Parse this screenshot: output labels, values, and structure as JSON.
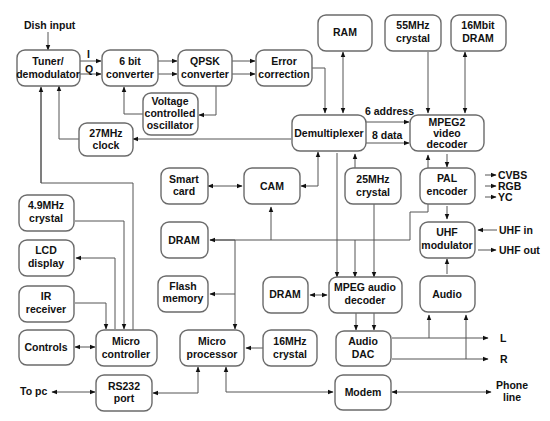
{
  "blocks": {
    "tuner": {
      "line1": "Tuner/",
      "line2": "demodulator"
    },
    "conv6": {
      "line1": "6 bit",
      "line2": "converter"
    },
    "qpsk": {
      "line1": "QPSK",
      "line2": "converter"
    },
    "errcorr": {
      "line1": "Error",
      "line2": "correction"
    },
    "vco": {
      "line1": "Voltage",
      "line2": "controlled",
      "line3": "oscillator"
    },
    "clock27": {
      "line1": "27MHz",
      "line2": "clock"
    },
    "ram": {
      "line1": "RAM"
    },
    "crystal55": {
      "line1": "55MHz",
      "line2": "crystal"
    },
    "dram16": {
      "line1": "16Mbit",
      "line2": "DRAM"
    },
    "demux": {
      "line1": "Demultiplexer"
    },
    "mpeg2": {
      "line1": "MPEG2",
      "line2": "video",
      "line3": "decoder"
    },
    "smartcard": {
      "line1": "Smart",
      "line2": "card"
    },
    "cam": {
      "line1": "CAM"
    },
    "crystal25": {
      "line1": "25MHz",
      "line2": "crystal"
    },
    "pal": {
      "line1": "PAL",
      "line2": "encoder"
    },
    "crystal49": {
      "line1": "4.9MHz",
      "line2": "crystal"
    },
    "dramL": {
      "line1": "DRAM"
    },
    "uhf": {
      "line1": "UHF",
      "line2": "modulator"
    },
    "lcd": {
      "line1": "LCD",
      "line2": "display"
    },
    "flash": {
      "line1": "Flash",
      "line2": "memory"
    },
    "dramA": {
      "line1": "DRAM"
    },
    "mpegaudio": {
      "line1": "MPEG audio",
      "line2": "decoder"
    },
    "audio": {
      "line1": "Audio"
    },
    "ir": {
      "line1": "IR",
      "line2": "receiver"
    },
    "controls": {
      "line1": "Controls"
    },
    "microctrl": {
      "line1": "Micro",
      "line2": "controller"
    },
    "microproc": {
      "line1": "Micro",
      "line2": "processor"
    },
    "crystal16": {
      "line1": "16MHz",
      "line2": "crystal"
    },
    "audiodac": {
      "line1": "Audio",
      "line2": "DAC"
    },
    "rs232": {
      "line1": "RS232",
      "line2": "port"
    },
    "modem": {
      "line1": "Modem"
    }
  },
  "labels": {
    "dish_input": "Dish input",
    "i": "I",
    "q": "Q",
    "addr": "6 address",
    "data": "8 data",
    "cvbs": "CVBS",
    "rgb": "RGB",
    "yc": "YC",
    "uhf_in": "UHF in",
    "uhf_out": "UHF out",
    "l": "L",
    "r": "R",
    "to_pc": "To pc",
    "phone1": "Phone",
    "phone2": "line"
  }
}
